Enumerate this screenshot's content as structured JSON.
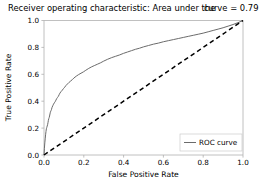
{
  "chart_data": {
    "type": "line",
    "title": "Receiver operating characteristic: Area under the     curve = 0.79",
    "title_main": "Receiver operating characteristic: Area under the",
    "title_auc": "curve = 0.79",
    "auc_value": 0.79,
    "xlabel": "False Positive Rate",
    "ylabel": "True Positive Rate",
    "xlim": [
      0.0,
      1.0
    ],
    "ylim": [
      0.0,
      1.0
    ],
    "grid": false,
    "legend_position": "lower right",
    "xticks": [
      "0.0",
      "0.2",
      "0.4",
      "0.6",
      "0.8",
      "1.0"
    ],
    "xtick_values": [
      0.0,
      0.2,
      0.4,
      0.6,
      0.8,
      1.0
    ],
    "yticks": [
      "0.0",
      "0.2",
      "0.4",
      "0.6",
      "0.8",
      "1.0"
    ],
    "ytick_values": [
      0.0,
      0.2,
      0.4,
      0.6,
      0.8,
      1.0
    ],
    "series": [
      {
        "name": "ROC curve",
        "color": "#6b6b6b",
        "linestyle": "solid",
        "x": [
          0.0,
          0.002,
          0.004,
          0.006,
          0.008,
          0.01,
          0.012,
          0.014,
          0.016,
          0.018,
          0.02,
          0.022,
          0.024,
          0.026,
          0.028,
          0.03,
          0.032,
          0.034,
          0.036,
          0.038,
          0.04,
          0.044,
          0.048,
          0.052,
          0.056,
          0.06,
          0.064,
          0.068,
          0.072,
          0.076,
          0.08,
          0.086,
          0.092,
          0.098,
          0.104,
          0.11,
          0.118,
          0.126,
          0.134,
          0.142,
          0.15,
          0.162,
          0.174,
          0.186,
          0.198,
          0.21,
          0.225,
          0.24,
          0.255,
          0.27,
          0.285,
          0.3,
          0.32,
          0.34,
          0.36,
          0.38,
          0.4,
          0.42,
          0.44,
          0.46,
          0.48,
          0.5,
          0.525,
          0.55,
          0.575,
          0.6,
          0.625,
          0.65,
          0.675,
          0.7,
          0.725,
          0.75,
          0.775,
          0.8,
          0.825,
          0.85,
          0.875,
          0.9,
          0.925,
          0.95,
          0.975,
          1.0
        ],
        "y": [
          0.0,
          0.05,
          0.09,
          0.12,
          0.15,
          0.175,
          0.195,
          0.205,
          0.215,
          0.225,
          0.24,
          0.258,
          0.27,
          0.278,
          0.29,
          0.305,
          0.318,
          0.326,
          0.332,
          0.34,
          0.352,
          0.366,
          0.378,
          0.388,
          0.396,
          0.408,
          0.42,
          0.428,
          0.436,
          0.448,
          0.46,
          0.472,
          0.482,
          0.494,
          0.504,
          0.516,
          0.528,
          0.54,
          0.55,
          0.56,
          0.572,
          0.586,
          0.598,
          0.608,
          0.618,
          0.63,
          0.644,
          0.656,
          0.666,
          0.676,
          0.686,
          0.698,
          0.712,
          0.724,
          0.734,
          0.744,
          0.756,
          0.766,
          0.776,
          0.786,
          0.794,
          0.804,
          0.814,
          0.824,
          0.832,
          0.842,
          0.85,
          0.858,
          0.866,
          0.874,
          0.882,
          0.89,
          0.898,
          0.906,
          0.916,
          0.926,
          0.936,
          0.946,
          0.958,
          0.97,
          0.984,
          1.0
        ]
      },
      {
        "name": "chance-diagonal",
        "color": "#000000",
        "linestyle": "dashed",
        "x": [
          0.0,
          1.0
        ],
        "y": [
          0.0,
          1.0
        ]
      }
    ],
    "legend_entries": [
      {
        "label": "ROC curve",
        "color": "#6b6b6b",
        "linestyle": "solid"
      }
    ]
  },
  "figure": {
    "background_color": "#ffffff",
    "axis_color": "#b0b0b0"
  }
}
